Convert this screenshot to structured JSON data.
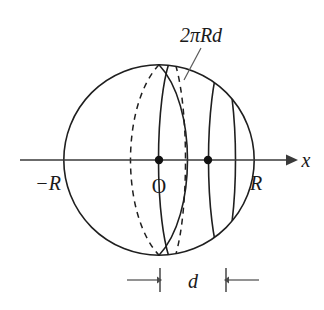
{
  "figure": {
    "type": "geometry-diagram",
    "background_color": "#ffffff",
    "ink_color": "#1f1f1f",
    "shade_color": "#e9e9e9"
  },
  "labels": {
    "zone_area": "2πRd",
    "axis": "x",
    "origin": "O",
    "radius_right": "R",
    "radius_left": "−R",
    "width": "d"
  },
  "geometry": {
    "sphere": {
      "center_x": 159,
      "center_y": 160,
      "radius": 96
    },
    "axis": {
      "y": 160,
      "x_start": 20,
      "x_end": 292,
      "arrow_tip_x": 292,
      "label_x": 305
    },
    "equator_ellipse": {
      "center_x": 159,
      "rx": 38,
      "ry": 100,
      "note": "great circle seen edge-on, back half dashed"
    },
    "zone": {
      "left_plane_x": 172,
      "right_plane_x": 222,
      "shade_note": "band between two parallel cutting planes"
    },
    "dots": [
      {
        "name": "origin-dot",
        "x": 159,
        "y": 160
      },
      {
        "name": "zone-center-dot",
        "x": 208,
        "y": 160
      }
    ],
    "dimension": {
      "y": 280,
      "left_tick_x": 160,
      "right_tick_x": 226,
      "label_x": 193
    },
    "leader": {
      "from_x": 201,
      "from_y": 48,
      "to_x": 184,
      "to_y": 80
    }
  }
}
